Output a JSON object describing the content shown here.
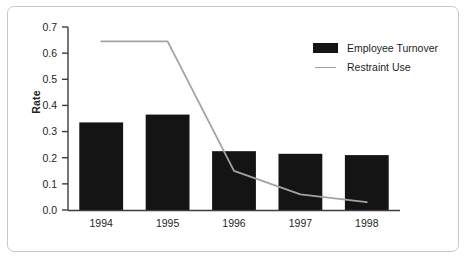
{
  "chart_data": {
    "type": "bar",
    "title": "",
    "subtitle": "",
    "xlabel": "",
    "ylabel": "Rate",
    "categories": [
      "1994",
      "1995",
      "1996",
      "1997",
      "1998"
    ],
    "ylim": [
      0.0,
      0.7
    ],
    "ytick_labels": [
      "0.0",
      "0.1",
      "0.2",
      "0.3",
      "0.4",
      "0.5",
      "0.6",
      "0.7"
    ],
    "ytick_values": [
      0.0,
      0.1,
      0.2,
      0.3,
      0.4,
      0.5,
      0.6,
      0.7
    ],
    "grid": false,
    "legend_position": "top-right",
    "series": [
      {
        "name": "Employee Turnover",
        "kind": "bar",
        "color": "#141414",
        "values": [
          0.335,
          0.365,
          0.225,
          0.215,
          0.21
        ]
      },
      {
        "name": "Restraint Use",
        "kind": "line",
        "color": "#a3a3a3",
        "values": [
          0.645,
          0.645,
          0.15,
          0.06,
          0.03
        ]
      }
    ]
  },
  "legend": {
    "items": [
      {
        "label": "Employee Turnover",
        "swatch": "bar-swatch",
        "color": "#141414"
      },
      {
        "label": "Restraint Use",
        "swatch": "line-swatch",
        "color": "#a3a3a3"
      }
    ]
  },
  "axes": {
    "y_title": "Rate"
  }
}
